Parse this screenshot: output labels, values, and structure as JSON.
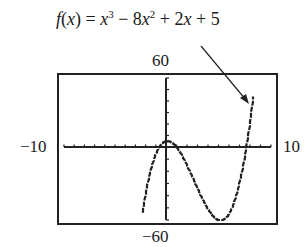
{
  "chart_data": {
    "type": "line",
    "title_parts": {
      "f": "f",
      "x": "x",
      "eq": " = ",
      "t1": "x",
      "e1": "3",
      "op1": " − 8",
      "t2": "x",
      "e2": "2",
      "op2": " + 2",
      "t3": "x",
      "op3": " + 5"
    },
    "xlabel": "",
    "ylabel": "",
    "xlim": [
      -10,
      10
    ],
    "ylim": [
      -60,
      60
    ],
    "x_tick_spacing": 1,
    "y_tick_spacing": 10,
    "grid": false,
    "window_labels": {
      "xmin": "−10",
      "xmax": "10",
      "ymin": "−60",
      "ymax": "60"
    },
    "annotation": "Arrow pointing to the curve near x ≈ 7.8 labeled with the function",
    "series": [
      {
        "name": "f(x)",
        "x": [
          -2.3,
          -2,
          -1.5,
          -1,
          -0.5,
          0,
          0.5,
          1,
          2,
          3,
          4,
          5,
          5.5,
          6,
          7,
          7.5,
          8,
          8.3
        ],
        "values": [
          -58.9,
          -39,
          -19.4,
          -6,
          1.9,
          5,
          4.1,
          0,
          -15,
          -34,
          -51,
          -60,
          -59.4,
          -55,
          -30,
          -10.6,
          21,
          38.1
        ]
      }
    ]
  }
}
